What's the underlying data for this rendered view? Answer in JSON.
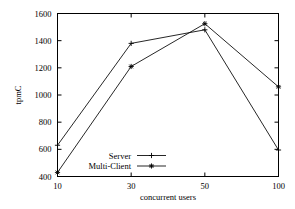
{
  "chart_data": {
    "type": "line",
    "title": "",
    "xlabel": "concurrent users",
    "ylabel": "tpmC",
    "categories": [
      "10",
      "30",
      "50",
      "100"
    ],
    "x": [
      10,
      30,
      50,
      100
    ],
    "xtick_labels": [
      "10",
      "30",
      "50",
      "100"
    ],
    "ytick_labels": [
      "400",
      "600",
      "800",
      "1000",
      "1200",
      "1400",
      "1600"
    ],
    "yticks": [
      400,
      600,
      800,
      1000,
      1200,
      1400,
      1600
    ],
    "ylim": [
      400,
      1600
    ],
    "grid": "off",
    "legend_position": "inside-lower-center-left",
    "series": [
      {
        "name": "Server",
        "marker": "plus",
        "color": "#000000",
        "values": [
          630,
          1380,
          1480,
          595
        ]
      },
      {
        "name": "Multi-Client",
        "marker": "star",
        "color": "#000000",
        "values": [
          430,
          1210,
          1525,
          1060
        ]
      }
    ]
  },
  "axes": {
    "y_label": "tpmC",
    "x_label": "concurrent users"
  },
  "legend": {
    "entries": [
      {
        "label": "Server"
      },
      {
        "label": "Multi-Client"
      }
    ]
  }
}
